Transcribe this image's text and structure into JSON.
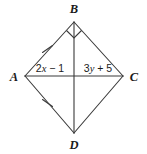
{
  "figure": {
    "type": "geometry-diagram",
    "shape_name": "quadrilateral ABCD",
    "background_color": "#ffffff",
    "line_color": "#3a3a3a",
    "text_color": "#1a1a1a",
    "vertices": [
      {
        "name": "A",
        "label": "A",
        "x": 25,
        "y": 76,
        "label_x": 14,
        "label_y": 81
      },
      {
        "name": "B",
        "label": "B",
        "x": 74,
        "y": 22,
        "label_x": 74,
        "label_y": 13
      },
      {
        "name": "C",
        "label": "C",
        "x": 123,
        "y": 76,
        "label_x": 134,
        "label_y": 81
      },
      {
        "name": "D",
        "label": "D",
        "x": 74,
        "y": 133,
        "label_x": 74,
        "label_y": 149
      }
    ],
    "edges": [
      {
        "name": "edge-AB",
        "from": "A",
        "to": "B",
        "ticks": 1
      },
      {
        "name": "edge-BC",
        "from": "B",
        "to": "C",
        "ticks": 0
      },
      {
        "name": "edge-CD",
        "from": "C",
        "to": "D",
        "ticks": 0
      },
      {
        "name": "edge-DA",
        "from": "D",
        "to": "A",
        "ticks": 1
      }
    ],
    "diagonals": [
      {
        "name": "diagonal-AC",
        "from": "A",
        "to": "C"
      },
      {
        "name": "diagonal-BD",
        "from": "B",
        "to": "D"
      }
    ],
    "intersection": {
      "x": 74,
      "y": 76
    },
    "right_angle_marker": {
      "at_vertex": "B",
      "x": 74,
      "y": 22,
      "size": 9
    },
    "segment_labels": [
      {
        "name": "label-2x-minus-1",
        "text": "2x − 1",
        "coefficient": "2",
        "variable": "x",
        "operator": "−",
        "constant": "1",
        "x": 56,
        "y": 72
      },
      {
        "name": "label-3y-plus-5",
        "text": "3y + 5",
        "coefficient": "3",
        "variable": "y",
        "operator": "+",
        "constant": "5",
        "x": 95,
        "y": 72
      }
    ]
  }
}
